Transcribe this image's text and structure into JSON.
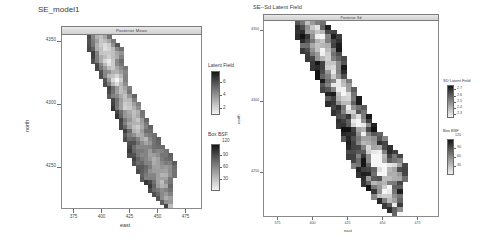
{
  "figure": {
    "background": "#ffffff",
    "panels": [
      {
        "id": "left",
        "title": "SE_model1",
        "strip_label": "Posterior Mean",
        "x_axis": {
          "label": "east",
          "ticks": [
            "375",
            "400",
            "425",
            "450",
            "475"
          ],
          "values": [
            375,
            400,
            425,
            450,
            475
          ],
          "range": [
            362,
            488
          ]
        },
        "y_axis": {
          "label": "north",
          "ticks": [
            "4350",
            "4300",
            "4250"
          ],
          "values": [
            4350,
            4300,
            4250
          ],
          "range": [
            4225,
            4372
          ]
        },
        "legends": [
          {
            "name": "latent-field",
            "title": "Latent Field",
            "ticks": [
              "6",
              "4",
              "2"
            ],
            "values": [
              6,
              4,
              2
            ],
            "range": [
              1,
              7
            ],
            "ramp": "gray"
          },
          {
            "name": "box-bsf",
            "title": "Box BSF",
            "ticks": [
              "120",
              "90",
              "60",
              "30"
            ],
            "values": [
              120,
              90,
              60,
              30
            ],
            "range": [
              15,
              130
            ],
            "ramp": "gray"
          }
        ]
      },
      {
        "id": "right",
        "title": "SE--Sd Latent Field",
        "strip_label": "Posterior Sd",
        "x_axis": {
          "label": "east",
          "ticks": [
            "375",
            "400",
            "425",
            "450",
            "475"
          ],
          "values": [
            375,
            400,
            425,
            450,
            475
          ],
          "range": [
            362,
            488
          ]
        },
        "y_axis": {
          "label": "north",
          "ticks": [
            "4350",
            "4300",
            "4250"
          ],
          "values": [
            4350,
            4300,
            4250
          ],
          "range": [
            4225,
            4372
          ]
        },
        "legends": [
          {
            "name": "sd-latent-field",
            "title": "SD Latent Field",
            "ticks": [
              "2.7",
              "2.6",
              "2.5",
              "2.4",
              "2.3"
            ],
            "values": [
              2.7,
              2.6,
              2.5,
              2.4,
              2.3
            ],
            "range": [
              2.25,
              2.75
            ],
            "ramp": "gray"
          },
          {
            "name": "box-bsf",
            "title": "Box BSF",
            "ticks": [
              "120",
              "90",
              "60",
              "30"
            ],
            "values": [
              120,
              90,
              60,
              30
            ],
            "range": [
              15,
              130
            ],
            "ramp": "gray"
          }
        ]
      }
    ]
  },
  "chart_data": [
    {
      "type": "heatmap",
      "name": "posterior-mean-latent-field",
      "title": "SE_model1",
      "subtitle": "Posterior Mean",
      "xlabel": "east",
      "ylabel": "north",
      "xlim": [
        362,
        488
      ],
      "ylim": [
        4225,
        4372
      ],
      "xticks": [
        375,
        400,
        425,
        450,
        475
      ],
      "yticks": [
        4250,
        4300,
        4350
      ],
      "grid": false,
      "colormap": "grayscale",
      "zlabel": "Latent Field",
      "zlim": [
        1,
        7
      ],
      "zticks": [
        2,
        4,
        6
      ],
      "secondary_legend": {
        "label": "Box BSF",
        "zlim": [
          15,
          130
        ],
        "zticks": [
          30,
          60,
          90,
          120
        ]
      },
      "description": "Grayscale raster of an elongated NW-SE trending region resembling the California outline, bright high-value ridge running down the spine with darker margins."
    },
    {
      "type": "heatmap",
      "name": "posterior-sd-latent-field",
      "title": "SE--Sd Latent Field",
      "subtitle": "Posterior Sd",
      "xlabel": "east",
      "ylabel": "north",
      "xlim": [
        362,
        488
      ],
      "ylim": [
        4225,
        4372
      ],
      "xticks": [
        375,
        400,
        425,
        450,
        475
      ],
      "yticks": [
        4250,
        4300,
        4350
      ],
      "grid": false,
      "colormap": "grayscale",
      "zlabel": "SD Latent Field",
      "zlim": [
        2.25,
        2.75
      ],
      "zticks": [
        2.3,
        2.4,
        2.5,
        2.6,
        2.7
      ],
      "secondary_legend": {
        "label": "Box BSF",
        "zlim": [
          15,
          130
        ],
        "zticks": [
          30,
          60,
          90,
          120
        ]
      },
      "description": "Grayscale raster of the same region showing posterior standard deviation; generally darker with a bright speckled central axis and bright patches near the southern lobe."
    }
  ]
}
